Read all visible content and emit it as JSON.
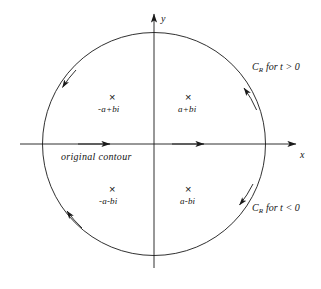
{
  "figure": {
    "axes": {
      "x_label": "x",
      "y_label": "y"
    },
    "contour_label": "original  contour",
    "poles": [
      {
        "name": "pole-second-quadrant",
        "marker": "×",
        "label": "-a+bi"
      },
      {
        "name": "pole-first-quadrant",
        "marker": "×",
        "label": "a+bi"
      },
      {
        "name": "pole-third-quadrant",
        "marker": "×",
        "label": "-a-bi"
      },
      {
        "name": "pole-fourth-quadrant",
        "marker": "×",
        "label": "a-bi"
      }
    ],
    "annotations": [
      {
        "name": "cr-upper",
        "base": "C",
        "subscript": "R",
        "condition": "for t > 0"
      },
      {
        "name": "cr-lower",
        "base": "C",
        "subscript": "R",
        "condition": "for t < 0"
      }
    ],
    "colors": {
      "stroke": "#1a1a1a",
      "background": "#ffffff"
    }
  }
}
